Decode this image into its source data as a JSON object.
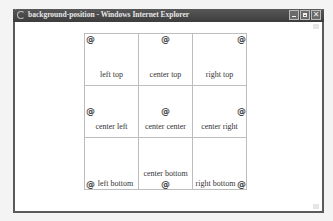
{
  "window": {
    "title": "background-position - Windows Internet Explorer",
    "controls": {
      "minimize": "_",
      "maximize": "□",
      "close": "✕"
    }
  },
  "icons": {
    "app": "ie-logo-icon",
    "marker": "@"
  },
  "grid": {
    "cells": [
      {
        "label": "left top",
        "position": "left top"
      },
      {
        "label": "center top",
        "position": "center top"
      },
      {
        "label": "right top",
        "position": "right top"
      },
      {
        "label": "center left",
        "position": "left center"
      },
      {
        "label": "center center",
        "position": "center center"
      },
      {
        "label": "center right",
        "position": "right center"
      },
      {
        "label": "left bottom",
        "position": "left bottom"
      },
      {
        "label": "center bottom",
        "position": "center bottom"
      },
      {
        "label": "right bottom",
        "position": "right bottom"
      }
    ]
  }
}
